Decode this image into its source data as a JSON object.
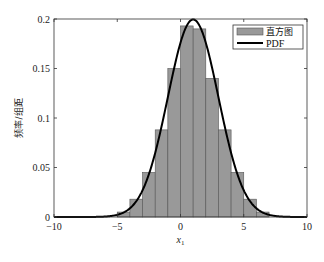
{
  "chart_data": {
    "type": "bar",
    "title": "",
    "xlabel": "x",
    "xlabel_subscript": "1",
    "ylabel": "频率/组距",
    "xlim": [
      -10,
      10
    ],
    "ylim": [
      0,
      0.2
    ],
    "xticks": [
      -10,
      -5,
      0,
      5,
      10
    ],
    "xtick_labels": [
      "−10",
      "−5",
      "0",
      "5",
      "10"
    ],
    "yticks": [
      0,
      0.05,
      0.1,
      0.15,
      0.2
    ],
    "ytick_labels": [
      "0",
      "0.05",
      "0.1",
      "0.15",
      "0.2"
    ],
    "grid": false,
    "legend_position": "top-right",
    "series": [
      {
        "name": "直方图",
        "kind": "histogram",
        "color": "#999999",
        "edge_color": "#555555",
        "bin_edges": [
          -5,
          -4,
          -3,
          -2,
          -1,
          0,
          1,
          2,
          3,
          4,
          5,
          6,
          7
        ],
        "values": [
          0.005,
          0.018,
          0.045,
          0.088,
          0.15,
          0.193,
          0.19,
          0.14,
          0.088,
          0.045,
          0.018,
          0.005
        ]
      },
      {
        "name": "PDF",
        "kind": "line",
        "color": "#000000",
        "distribution": "normal",
        "mean": 1,
        "std": 2
      }
    ]
  }
}
